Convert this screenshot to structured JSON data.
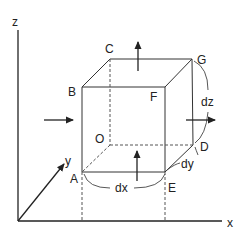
{
  "diagram": {
    "title": "",
    "axes": {
      "x_label": "x",
      "y_label": "y",
      "z_label": "z"
    },
    "vertices": {
      "A": "A",
      "B": "B",
      "C": "C",
      "D": "D",
      "E": "E",
      "F": "F",
      "G": "G",
      "O": "O"
    },
    "dimensions": {
      "dx": "dx",
      "dy": "dy",
      "dz": "dz"
    },
    "colors": {
      "line": "#333333",
      "dashed": "#555555"
    }
  }
}
